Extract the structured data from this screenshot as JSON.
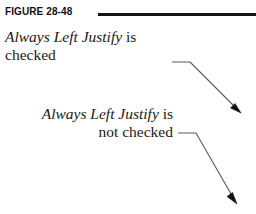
{
  "figure": {
    "label": "FIGURE 28-48",
    "rule_color": "#141414",
    "background_color": "#ffffff",
    "text_color": "#1a1a1a",
    "width": 256,
    "height": 214
  },
  "captions": [
    {
      "id": "checked",
      "align": "left",
      "line1_italic": "Always Left Justify",
      "line1_roman": " is",
      "line2": "checked"
    },
    {
      "id": "not-checked",
      "align": "right",
      "line1_italic": "Always Left Justify",
      "line1_roman": " is",
      "line2": "not checked"
    }
  ],
  "leaders": [
    {
      "id": "leader-checked",
      "from_label": "checked",
      "color": "#5a5a5a",
      "arrowhead_color": "#111111"
    },
    {
      "id": "leader-not-checked",
      "from_label": "not checked",
      "color": "#5a5a5a",
      "arrowhead_color": "#111111"
    }
  ]
}
